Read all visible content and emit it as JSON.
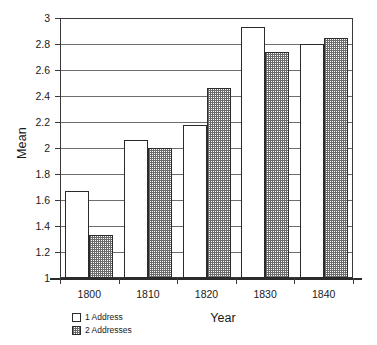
{
  "chart_data": {
    "type": "bar",
    "title": "",
    "xlabel": "Year",
    "ylabel": "Mean",
    "categories": [
      "1800",
      "1810",
      "1820",
      "1830",
      "1840"
    ],
    "series": [
      {
        "name": "1 Address",
        "values": [
          1.67,
          2.06,
          2.18,
          2.93,
          2.8
        ]
      },
      {
        "name": "2 Addresses",
        "values": [
          1.33,
          2.0,
          2.46,
          2.74,
          2.85
        ]
      }
    ],
    "ylim": [
      1,
      3
    ],
    "ytick_labels": [
      "1",
      "1.2",
      "1.4",
      "1.6",
      "1.8",
      "2",
      "2.2",
      "2.4",
      "2.6",
      "2.8",
      "3"
    ],
    "ytick_values": [
      1,
      1.2,
      1.4,
      1.6,
      1.8,
      2,
      2.2,
      2.4,
      2.6,
      2.8,
      3
    ],
    "grid": true,
    "grid_axis": "y",
    "legend_position": "bottom-left",
    "colors": {
      "series_one_fill": "#ffffff",
      "series_two_fill": "#6b6b6b",
      "axis": "#2b2b2b",
      "gridline": "#6e6e6e"
    }
  }
}
